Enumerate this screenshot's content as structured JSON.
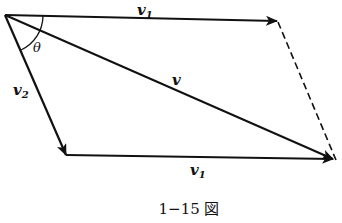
{
  "diagram": {
    "caption": "1−15 図",
    "vectors": [
      {
        "id": "v1_top",
        "label": "v",
        "subscript": "1",
        "from": "O",
        "to": "A"
      },
      {
        "id": "v2",
        "label": "v",
        "subscript": "2",
        "from": "O",
        "to": "B"
      },
      {
        "id": "v1_bottom",
        "label": "v",
        "subscript": "1",
        "from": "B",
        "to": "C"
      },
      {
        "id": "v_resultant",
        "label": "v",
        "subscript": "",
        "from": "O",
        "to": "C"
      }
    ],
    "angle_label": "θ",
    "dashed_edge": {
      "from": "A",
      "to": "C"
    },
    "colors": {
      "ink": "#111111",
      "background": "#ffffff"
    }
  },
  "labels": {
    "v1_top": "v",
    "v1_top_sub": "1",
    "v2": "v",
    "v2_sub": "2",
    "v_resultant": "v",
    "v1_bottom": "v",
    "v1_bottom_sub": "1",
    "theta": "θ"
  }
}
